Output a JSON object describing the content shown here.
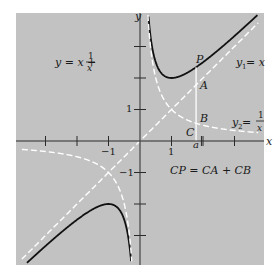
{
  "chart_data": {
    "type": "line",
    "title": "",
    "xlabel": "x",
    "ylabel": "y",
    "xlim": [
      -3.9,
      3.95
    ],
    "ylim": [
      -3.95,
      4.0
    ],
    "grid": false,
    "panel_color": "#c2c2c2",
    "origin_px": [
      140,
      141
    ],
    "unit_px": 31.5,
    "x_ticks": [
      -3,
      -2,
      -1,
      1,
      2,
      3
    ],
    "y_ticks": [
      -3,
      -2,
      -1,
      1,
      2,
      3
    ],
    "x_tick_labels": [
      {
        "value": -1,
        "label": "−1"
      },
      {
        "value": 1,
        "label": "1"
      },
      {
        "value": 1.95,
        "label": "a"
      }
    ],
    "y_tick_labels": [
      {
        "value": 1,
        "label": "1"
      },
      {
        "value": -1,
        "label": "−1"
      }
    ],
    "series": [
      {
        "name": "y = x + 1/x",
        "style": "solid",
        "color": "#111111",
        "function": "x+1/x",
        "domains": [
          [
            0.26,
            3.75
          ],
          [
            -3.75,
            -0.26
          ]
        ]
      },
      {
        "name": "y1 = x",
        "style": "dashed",
        "color": "#ffffff",
        "function": "x",
        "domains": [
          [
            -3.75,
            3.75
          ]
        ]
      },
      {
        "name": "y2 = 1/x",
        "style": "dashed",
        "color": "#ffffff",
        "function": "1/x",
        "domains": [
          [
            0.25,
            3.75
          ],
          [
            -3.75,
            -0.25
          ]
        ]
      }
    ],
    "vertical_segment": {
      "x": 1.78,
      "y_from": 0,
      "y_to": 2.34,
      "color": "#ffffff"
    },
    "annotations": {
      "main_eq": {
        "lhs": "y = x +",
        "num": "1",
        "den": "x"
      },
      "y1_label": {
        "base": "y",
        "sub": "1",
        "rest": " = x"
      },
      "y2_label": {
        "base": "y",
        "sub": "2",
        "rest": " =",
        "num": "1",
        "den": "x"
      },
      "P": "P",
      "A": "A",
      "B": "B",
      "C": "C",
      "relation": "CP = CA + CB",
      "x_axis_label": "x",
      "y_axis_label": "y"
    }
  }
}
